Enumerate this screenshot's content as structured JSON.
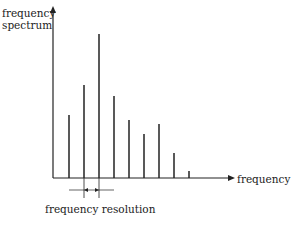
{
  "diagram": {
    "y_label_line1": "frequency",
    "y_label_line2": "spectrum",
    "x_label": "frequency",
    "resolution_label": "frequency resolution",
    "line_color": "#222222"
  },
  "chart_data": {
    "type": "bar",
    "title": "",
    "xlabel": "frequency",
    "ylabel": "frequency spectrum",
    "annotation": "frequency resolution",
    "categories": [
      1,
      2,
      3,
      4,
      5,
      6,
      7,
      8,
      9
    ],
    "values": [
      63,
      93,
      144,
      82,
      58,
      44,
      54,
      25,
      7
    ]
  }
}
